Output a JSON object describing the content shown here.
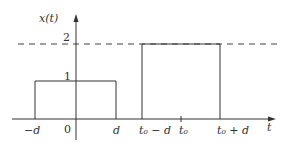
{
  "diagram": {
    "type": "signal-plot",
    "y_axis_label": "x(t)",
    "x_axis_label": "t",
    "y_ticks": [
      {
        "label": "1",
        "value": 1
      },
      {
        "label": "2",
        "value": 2
      }
    ],
    "x_ticks": [
      {
        "label": "−d"
      },
      {
        "label": "0"
      },
      {
        "label": "d"
      },
      {
        "label": "t₀ − d"
      },
      {
        "label": "t₀"
      },
      {
        "label": "t₀ + d"
      }
    ],
    "pulses": [
      {
        "name": "pulse-1",
        "from": "−d",
        "to": "d",
        "height": 1
      },
      {
        "name": "pulse-2",
        "from": "t₀ − d",
        "to": "t₀ + d",
        "height": 2
      }
    ],
    "dashed_reference_level": 2,
    "colors": {
      "line": "#333333",
      "background": "#ffffff"
    }
  }
}
